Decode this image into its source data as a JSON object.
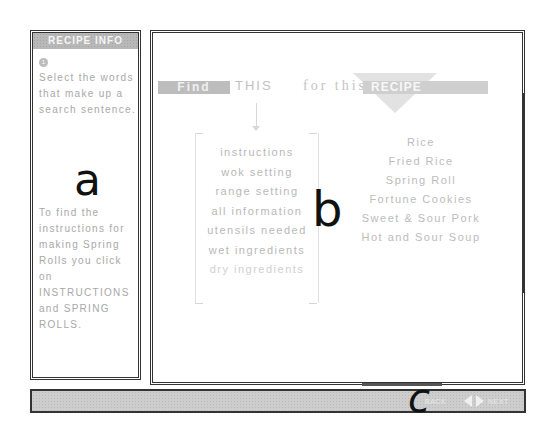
{
  "sidebar": {
    "header": "RECIPE INFO",
    "step_icon": "1",
    "instruction": "Select the words that make up a search sentence.",
    "example": "To find the instructions for making Spring Rolls you click on INSTRUCTIONS and SPRING ROLLS."
  },
  "main": {
    "heading": {
      "find": "Find",
      "this": "THIS",
      "for_this": "for this",
      "recipe": "RECIPE"
    },
    "words": [
      "instructions",
      "wok setting",
      "range setting",
      "all information",
      "utensils needed",
      "wet ingredients",
      "dry ingredients"
    ],
    "recipes": [
      "Rice",
      "Fried Rice",
      "Spring Roll",
      "Fortune Cookies",
      "Sweet & Sour Pork",
      "Hot and Sour Soup"
    ]
  },
  "status_bar": {
    "nav_label": "BACK",
    "prev_icon": "left-triangle",
    "next_icon": "right-triangle",
    "end_label": "NEXT"
  },
  "annotations": {
    "a": "a",
    "b": "b",
    "c": "c"
  }
}
